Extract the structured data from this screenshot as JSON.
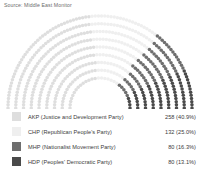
{
  "source": {
    "text": "Source: Middle East Monitor"
  },
  "chart_data": {
    "type": "pie",
    "subtype": "parliament-hemicycle",
    "title": "",
    "xlabel": "",
    "ylabel": "",
    "total_seats": 550,
    "rows": 9,
    "categories": [
      "AKP (Justice and Development Party)",
      "CHP (Republican People's Party)",
      "MHP (Nationalist Movement Party)",
      "HDP (Peoples' Democratic Party)"
    ],
    "values": [
      258,
      132,
      80,
      80
    ],
    "percents": [
      40.9,
      25.0,
      16.3,
      13.1
    ],
    "colors": [
      "#dedede",
      "#efefef",
      "#6e6e6e",
      "#4a4a4a"
    ],
    "legend_position": "bottom"
  },
  "legend": {
    "items": [
      {
        "abbr": "AKP",
        "label": "AKP (Justice and Development Party)",
        "value": "258 (40.9%)",
        "seats": 258,
        "percent": "40.9%",
        "color": "#dedede"
      },
      {
        "abbr": "CHP",
        "label": "CHP (Republican People's Party)",
        "value": "132 (25.0%)",
        "seats": 132,
        "percent": "25.0%",
        "color": "#efefef"
      },
      {
        "abbr": "MHP",
        "label": "MHP (Nationalist Movement Party)",
        "value": "80 (16.3%)",
        "seats": 80,
        "percent": "16.3%",
        "color": "#6e6e6e"
      },
      {
        "abbr": "HDP",
        "label": "HDP (Peoples' Democratic Party)",
        "value": "80 (13.1%)",
        "seats": 80,
        "percent": "13.1%",
        "color": "#4a4a4a"
      }
    ]
  }
}
